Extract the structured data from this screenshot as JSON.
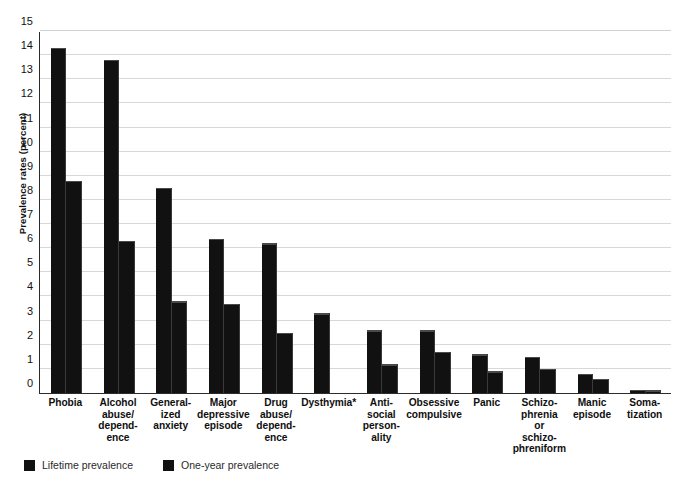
{
  "chart_data": {
    "type": "bar",
    "title": "",
    "xlabel": "",
    "ylabel": "Prevalence rates (percent)",
    "ylim": [
      0,
      15
    ],
    "yticks": [
      0,
      1,
      2,
      3,
      4,
      5,
      6,
      7,
      8,
      9,
      10,
      11,
      12,
      13,
      14,
      15
    ],
    "ytick_labels": [
      "0",
      "1",
      "2",
      "3",
      "4",
      "5",
      "6",
      "7",
      "8",
      "9",
      "10",
      "11",
      "12",
      "13",
      "14",
      "15"
    ],
    "grid": true,
    "legend_position": "bottom-left",
    "bar_color": "#111111",
    "gridline_color": "#d8d8d8",
    "axis_color": "#2b2b2b",
    "categories": [
      {
        "lines": [
          "Phobia"
        ]
      },
      {
        "lines": [
          "Alcohol",
          "abuse/",
          "depend-",
          "ence"
        ]
      },
      {
        "lines": [
          "General-",
          "ized",
          "anxiety"
        ]
      },
      {
        "lines": [
          "Major",
          "depressive",
          "episode"
        ]
      },
      {
        "lines": [
          "Drug",
          "abuse/",
          "depend-",
          "ence"
        ]
      },
      {
        "lines": [
          "Dysthymia*"
        ]
      },
      {
        "lines": [
          "Anti-",
          "social",
          "person-",
          "ality"
        ]
      },
      {
        "lines": [
          "Obsessive",
          "compulsive"
        ]
      },
      {
        "lines": [
          "Panic"
        ]
      },
      {
        "lines": [
          "Schizo-",
          "phrenia",
          "or",
          "schizo-",
          "phreniform"
        ]
      },
      {
        "lines": [
          "Manic",
          "episode"
        ]
      },
      {
        "lines": [
          "Soma-",
          "tization"
        ]
      }
    ],
    "series": [
      {
        "name": "Lifetime prevalence",
        "color": "#111111",
        "values": [
          14.3,
          13.8,
          8.5,
          6.4,
          6.2,
          3.3,
          2.6,
          2.6,
          1.6,
          1.5,
          0.8,
          0.14
        ]
      },
      {
        "name": "One-year prevalence",
        "color": "#111111",
        "values": [
          8.8,
          6.3,
          3.8,
          3.7,
          2.5,
          null,
          1.2,
          1.7,
          0.9,
          1.0,
          0.6,
          0.12
        ]
      }
    ],
    "footnote_marker": "*"
  },
  "legend": {
    "items": [
      {
        "label": "Lifetime prevalence",
        "swatch": "legend-swatch-lifetime"
      },
      {
        "label": "One-year prevalence",
        "swatch": "legend-swatch-oneyear"
      }
    ]
  }
}
